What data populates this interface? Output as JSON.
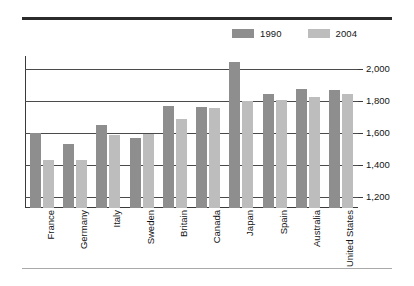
{
  "chart_data": {
    "type": "bar",
    "title": "",
    "subtitle": "",
    "xlabel": "",
    "ylabel": "",
    "ylim": [
      1130,
      2080
    ],
    "yticks": [
      1200,
      1400,
      1600,
      1800,
      2000
    ],
    "ytick_labels": [
      "1,200",
      "1,400",
      "1,600",
      "1,800",
      "2,000"
    ],
    "grid": true,
    "legend_position": "top-right",
    "categories": [
      "France",
      "Germany",
      "Italy",
      "Sweden",
      "Britain",
      "Canada",
      "Japan",
      "Spain",
      "Australia",
      "United States"
    ],
    "series": [
      {
        "name": "1990",
        "color": "#8e8e8e",
        "values": [
          1600,
          1530,
          1650,
          1565,
          1765,
          1760,
          2040,
          1840,
          1875,
          1870
        ]
      },
      {
        "name": "2004",
        "color": "#bdbdbd",
        "values": [
          1430,
          1430,
          1585,
          1590,
          1685,
          1755,
          1800,
          1805,
          1825,
          1845
        ]
      }
    ]
  },
  "legend": {
    "entries": [
      {
        "label": "1990",
        "color": "#8e8e8e"
      },
      {
        "label": "2004",
        "color": "#bdbdbd"
      }
    ]
  },
  "colors": {
    "series_1990": "#8e8e8e",
    "series_2004": "#bdbdbd",
    "axis": "#3a3a3a",
    "gridline": "#4a4a4a",
    "top_rule": "#2b2b2b",
    "bottom_rule": "#a9a9a9",
    "text": "#141414",
    "background": "#ffffff"
  }
}
